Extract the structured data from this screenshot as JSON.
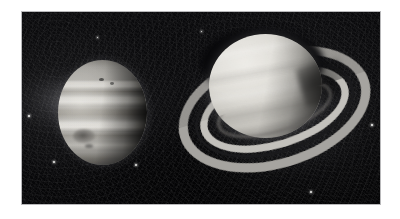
{
  "page": {
    "background_color": "#ffffff"
  },
  "plate": {
    "name": "astronomy-photo-plate",
    "border_color": "#b9b9bb",
    "background_color": "#050506",
    "x": 21,
    "y": 11,
    "width": 360,
    "height": 194
  },
  "objects": [
    {
      "id": "jupiter",
      "name": "Jupiter",
      "description": "Gas giant showing horizontal cloud belts and zones with the Great Red Spot as a dark oval in the lower-left quadrant; right limb in shadow",
      "features": [
        "north-polar-hood",
        "north-temperate-belt",
        "north-equatorial-belt",
        "equatorial-zone",
        "south-equatorial-belt",
        "great-red-spot",
        "terminator-shadow"
      ],
      "x": 36,
      "y": 48,
      "width": 89,
      "height": 105,
      "tone": "#a9a7a2"
    },
    {
      "id": "saturn",
      "name": "Saturn",
      "description": "Ringed gas giant tilted so the rings open toward the lower left; Cassini Division visible as a dark gap between the A and B rings, globe shadow falls on the rings at right",
      "features": [
        "a-ring",
        "cassini-division",
        "b-ring",
        "c-ring",
        "globe-banding",
        "ring-shadow",
        "terminator-shadow"
      ],
      "x": 150,
      "y": 16,
      "width": 205,
      "height": 158,
      "tone": "#dcdad4",
      "ring_tilt_degrees": -17
    }
  ],
  "field_points": [
    {
      "name": "moon-or-star-1",
      "x": 52,
      "y": 160,
      "size": 2.4
    },
    {
      "name": "moon-or-star-2",
      "x": 134,
      "y": 163,
      "size": 2.2
    },
    {
      "name": "moon-or-star-3",
      "x": 27,
      "y": 114,
      "size": 1.6
    },
    {
      "name": "moon-or-star-4",
      "x": 309,
      "y": 190,
      "size": 1.8
    },
    {
      "name": "moon-or-star-5",
      "x": 370,
      "y": 123,
      "size": 1.5
    },
    {
      "name": "moon-or-star-6",
      "x": 200,
      "y": 30,
      "size": 1.3
    },
    {
      "name": "moon-or-star-7",
      "x": 96,
      "y": 36,
      "size": 1.2
    }
  ],
  "colors": {
    "page": "#ffffff",
    "space": "#050506",
    "frame": "#b9b9bb",
    "jupiter_mid": "#a9a7a2",
    "saturn_bright": "#dcdad4",
    "ring_bright": "#c4c2bd",
    "cassini_division": "#1a1a1c"
  }
}
